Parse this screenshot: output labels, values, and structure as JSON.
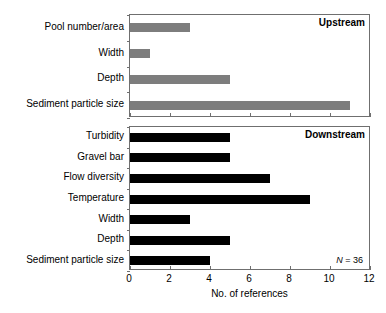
{
  "chart_data": {
    "type": "bar",
    "orientation": "horizontal",
    "title": "",
    "xlabel": "No. of references",
    "ylabel": "",
    "xlim": [
      0,
      12
    ],
    "xticks": [
      0,
      2,
      4,
      6,
      8,
      10,
      12
    ],
    "grid": false,
    "legend": "none",
    "panels": [
      {
        "name": "upstream",
        "label": "Upstream",
        "bar_color": "#7d7d7d",
        "categories": [
          "Pool number/area",
          "Width",
          "Depth",
          "Sediment particle size"
        ],
        "values": [
          3,
          1,
          5,
          11
        ],
        "annotation": ""
      },
      {
        "name": "downstream",
        "label": "Downstream",
        "bar_color": "#000000",
        "categories": [
          "Turbidity",
          "Gravel bar",
          "Flow diversity",
          "Temperature",
          "Width",
          "Depth",
          "Sediment particle size"
        ],
        "values": [
          5,
          5,
          7,
          9,
          3,
          5,
          4
        ],
        "annotation": "N = 36",
        "annotation_italic_prefix": "N",
        "annotation_rest": " = 36"
      }
    ]
  },
  "colors": {
    "upstream_bar": "#7d7d7d",
    "downstream_bar": "#000000",
    "axis": "#6f6f6f",
    "background": "#ffffff",
    "text": "#000000"
  }
}
